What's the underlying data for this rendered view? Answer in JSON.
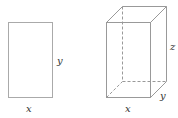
{
  "figure": {
    "rectangle": {
      "width_label": "x",
      "height_label": "y"
    },
    "box": {
      "width_label": "x",
      "depth_label": "y",
      "height_label": "z"
    }
  },
  "colors": {
    "stroke": "#999999",
    "label": "#333333"
  }
}
